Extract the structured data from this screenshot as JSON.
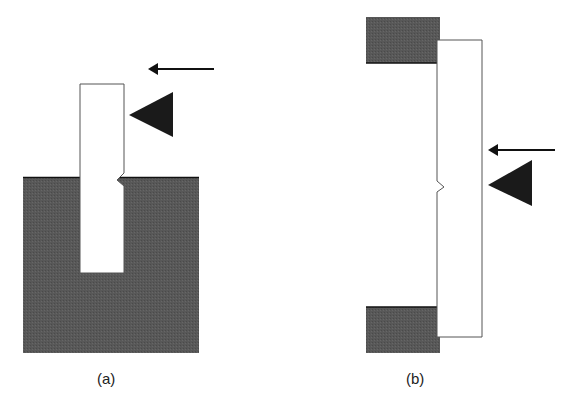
{
  "figure": {
    "panels": [
      {
        "id": "a",
        "label": "(a)",
        "description": "Charpy-type: specimen clamped at base in vise, struck by hammer above notch"
      },
      {
        "id": "b",
        "label": "(b)",
        "description": "Simply supported specimen on two supports, struck opposite the notch"
      }
    ],
    "colors": {
      "support": "#555555",
      "specimen_fill": "#ffffff",
      "specimen_stroke": "#555555",
      "hammer": "#1a1a1a",
      "arrow": "#111111"
    }
  }
}
